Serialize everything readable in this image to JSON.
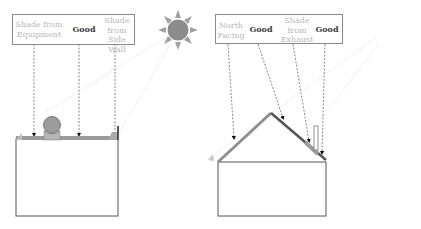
{
  "left_diagram": {
    "labels": [
      {
        "text": "Shade from Equipment",
        "status": "shaded"
      },
      {
        "text": "Good",
        "status": "good"
      },
      {
        "text": "Shade from Side Wall",
        "status": "shaded"
      }
    ],
    "building": "flat-roof",
    "obstructions": [
      "rooftop-equipment",
      "side-wall-parapet"
    ]
  },
  "right_diagram": {
    "labels": [
      {
        "text": "North Facing",
        "status": "shaded"
      },
      {
        "text": "Good",
        "status": "good"
      },
      {
        "text": "Shade from Exhaust",
        "status": "shaded"
      },
      {
        "text": "Good",
        "status": "good"
      }
    ],
    "building": "pitched-roof",
    "obstructions": [
      "exhaust-pipe"
    ]
  },
  "icons": {
    "sun_left": "sun-icon",
    "sun_right": "sun-icon"
  },
  "colors": {
    "good_text": "#3a3a3a",
    "shaded_text": "#b8b8b8",
    "roof_panel": "#9a9a9a",
    "sun": "#8c8c8c",
    "outline": "#555555"
  }
}
